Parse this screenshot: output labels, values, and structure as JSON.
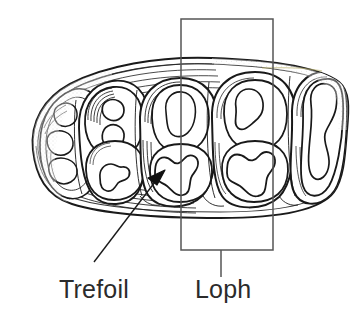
{
  "figure": {
    "type": "scientific-illustration",
    "background_color": "#ffffff",
    "ink_color": "#1a1a1a",
    "annotation_color": "#2b2b2b",
    "callout_line_color": "#555555"
  },
  "labels": {
    "trefoil": "Trefoil",
    "loph": "Loph"
  },
  "annotations": {
    "trefoil_arrow": {
      "name": "arrow-pointer",
      "from": [
        94,
        262
      ],
      "to": [
        163,
        172
      ]
    },
    "loph_box": {
      "name": "highlight-rectangle",
      "x": 181,
      "y": 19,
      "width": 92,
      "height": 231
    },
    "loph_leader": {
      "name": "leader-line",
      "from": [
        221,
        250
      ],
      "to": [
        221,
        277
      ]
    }
  }
}
